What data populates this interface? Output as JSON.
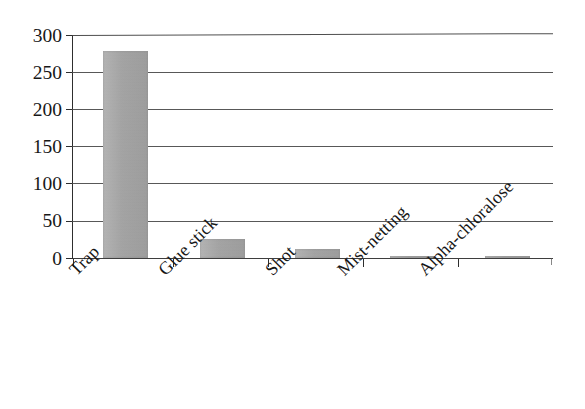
{
  "chart_data": {
    "type": "bar",
    "title": "",
    "subtitle": "",
    "xlabel": "",
    "ylabel": "",
    "categories": [
      "Trap",
      "Glue stick",
      "Shot",
      "Mist-netting",
      "Alpha-chloralose"
    ],
    "values": [
      278,
      25,
      12,
      3,
      3
    ],
    "series": [
      {
        "name": "",
        "values": [
          278,
          25,
          12,
          3,
          3
        ]
      }
    ],
    "ylim": [
      0,
      300
    ],
    "yticks": [
      0,
      50,
      100,
      150,
      200,
      250,
      300
    ],
    "ytick_labels": [
      "0",
      "50",
      "100",
      "150",
      "200",
      "250",
      "300"
    ],
    "grid": "horizontal",
    "legend": "none",
    "bar_color": "#a8a8a8",
    "axis_color": "#2e2e2e",
    "gridline_color": "#4a4a4a",
    "background": "#ffffff",
    "xtick_label_rotation": -45,
    "annotations": []
  },
  "figure": {
    "name": "bar-chart"
  }
}
